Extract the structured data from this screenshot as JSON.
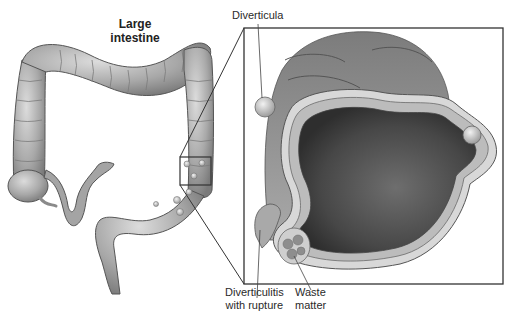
{
  "diagram": {
    "labels": {
      "title_line1": "Large",
      "title_line2": "intestine",
      "diverticula": "Diverticula",
      "rupture_line1": "Diverticulitis",
      "rupture_line2": "with rupture",
      "waste_line1": "Waste",
      "waste_line2": "matter"
    },
    "panels": [
      {
        "name": "overview",
        "depicts": "whole large intestine (colon) with magnification box on descending/sigmoid colon"
      },
      {
        "name": "inset",
        "depicts": "magnified cross-section of colon wall showing diverticula pouches"
      }
    ],
    "colors": {
      "tissue_light": "#c8c8c8",
      "tissue_mid": "#9a9a9a",
      "tissue_dark": "#5a5a5a",
      "lumen": "#4a4a4a",
      "outline": "#333333"
    }
  }
}
